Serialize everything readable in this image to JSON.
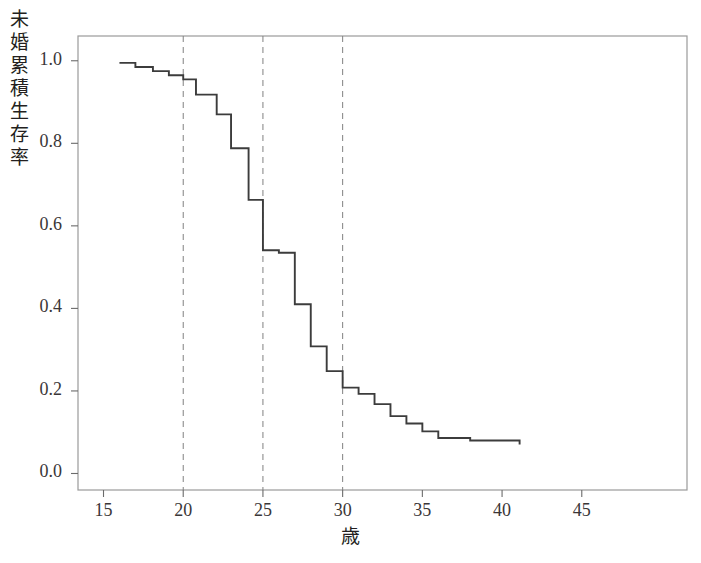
{
  "chart_data": {
    "type": "line",
    "subtype": "kaplan-meier-step",
    "title": "",
    "xlabel": "歳",
    "ylabel": "未婚累積生存率",
    "xlim": [
      13.4,
      51.6
    ],
    "ylim": [
      -0.04,
      1.06
    ],
    "xticks": [
      15,
      20,
      25,
      30,
      35,
      40,
      45
    ],
    "xtick_labels": [
      "15",
      "20",
      "25",
      "30",
      "35",
      "40",
      "45"
    ],
    "yticks": [
      0.0,
      0.2,
      0.4,
      0.6,
      0.8,
      1.0
    ],
    "ytick_labels": [
      "0.0",
      "0.2",
      "0.4",
      "0.6",
      "0.8",
      "1.0"
    ],
    "grid": false,
    "legend": null,
    "reference_lines": {
      "orientation": "vertical",
      "style": "dashed",
      "color": "#808080",
      "x_values": [
        20,
        25,
        30
      ]
    },
    "line_color": "#3c3c3c",
    "series": [
      {
        "name": "未婚累積生存率",
        "step": "post",
        "x": [
          16.0,
          17.0,
          18.1,
          19.1,
          20.0,
          20.8,
          22.1,
          23.0,
          24.1,
          25.0,
          26.0,
          27.0,
          28.0,
          29.0,
          30.0,
          31.0,
          32.0,
          33.0,
          34.0,
          35.0,
          36.0,
          38.0,
          41.1
        ],
        "y": [
          0.995,
          0.985,
          0.975,
          0.965,
          0.955,
          0.918,
          0.87,
          0.788,
          0.663,
          0.541,
          0.535,
          0.41,
          0.308,
          0.248,
          0.208,
          0.193,
          0.168,
          0.139,
          0.121,
          0.102,
          0.086,
          0.08,
          0.07
        ]
      }
    ]
  },
  "axes": {
    "y_axis_label_chars": [
      "未",
      "婚",
      "累",
      "積",
      "生",
      "存",
      "率"
    ],
    "x_axis_label": "歳"
  }
}
